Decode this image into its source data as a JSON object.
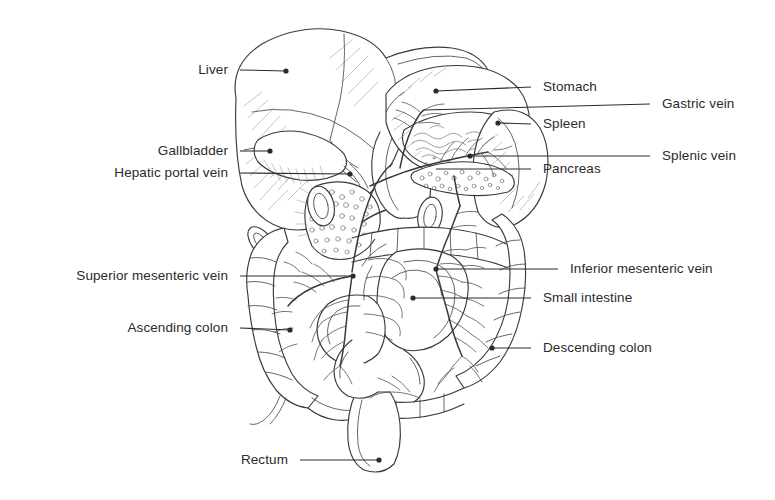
{
  "figure": {
    "type": "anatomical-line-diagram",
    "background_color": "#ffffff",
    "ink_color": "#2b2b2b",
    "leader_line_color": "#2b2b2b",
    "label_font_size_px": 13.5
  },
  "labels": [
    {
      "id": "liver",
      "text": "Liver",
      "side": "left",
      "text_x": 228,
      "text_y": 70,
      "line_x1": 240,
      "line_y1": 70,
      "line_x2": 286,
      "line_y2": 71,
      "dot": true
    },
    {
      "id": "gallbladder",
      "text": "Gallbladder",
      "side": "left",
      "text_x": 228,
      "text_y": 151,
      "line_x1": 240,
      "line_y1": 151,
      "line_x2": 270,
      "line_y2": 151,
      "dot": true
    },
    {
      "id": "hepatic-portal-vein",
      "text": "Hepatic portal vein",
      "side": "left",
      "text_x": 228,
      "text_y": 173,
      "line_x1": 240,
      "line_y1": 173,
      "line_x2": 350,
      "line_y2": 174,
      "dot": true
    },
    {
      "id": "superior-mesenteric-vein",
      "text": "Superior mesenteric vein",
      "side": "left",
      "text_x": 228,
      "text_y": 276,
      "line_x1": 240,
      "line_y1": 276,
      "line_x2": 353,
      "line_y2": 276,
      "dot": true
    },
    {
      "id": "ascending-colon",
      "text": "Ascending colon",
      "side": "left",
      "text_x": 228,
      "text_y": 328,
      "line_x1": 240,
      "line_y1": 328,
      "line_x2": 290,
      "line_y2": 330,
      "dot": true
    },
    {
      "id": "rectum",
      "text": "Rectum",
      "side": "left",
      "text_x": 288,
      "text_y": 460,
      "line_x1": 300,
      "line_y1": 460,
      "line_x2": 379,
      "line_y2": 460,
      "dot": true
    },
    {
      "id": "stomach",
      "text": "Stomach",
      "side": "right",
      "text_x": 543,
      "text_y": 87,
      "line_x1": 531,
      "line_y1": 87,
      "line_x2": 436,
      "line_y2": 91,
      "dot": true
    },
    {
      "id": "gastric-vein",
      "text": "Gastric vein",
      "side": "right",
      "text_x": 662,
      "text_y": 104,
      "line_x1": 650,
      "line_y1": 104,
      "line_x2": 424,
      "line_y2": 110,
      "dot": false
    },
    {
      "id": "spleen",
      "text": "Spleen",
      "side": "right",
      "text_x": 543,
      "text_y": 124,
      "line_x1": 531,
      "line_y1": 124,
      "line_x2": 498,
      "line_y2": 123,
      "dot": true
    },
    {
      "id": "splenic-vein",
      "text": "Splenic vein",
      "side": "right",
      "text_x": 662,
      "text_y": 156,
      "line_x1": 650,
      "line_y1": 156,
      "line_x2": 470,
      "line_y2": 156,
      "dot": true
    },
    {
      "id": "pancreas",
      "text": "Pancreas",
      "side": "right",
      "text_x": 543,
      "text_y": 169,
      "line_x1": 531,
      "line_y1": 169,
      "line_x2": 436,
      "line_y2": 169,
      "dot": false
    },
    {
      "id": "inferior-mesenteric-vein",
      "text": "Inferior mesenteric vein",
      "side": "right",
      "text_x": 570,
      "text_y": 269,
      "line_x1": 558,
      "line_y1": 269,
      "line_x2": 436,
      "line_y2": 269,
      "dot": true
    },
    {
      "id": "small-intestine",
      "text": "Small intestine",
      "side": "right",
      "text_x": 543,
      "text_y": 298,
      "line_x1": 531,
      "line_y1": 298,
      "line_x2": 413,
      "line_y2": 298,
      "dot": true
    },
    {
      "id": "descending-colon",
      "text": "Descending colon",
      "side": "right",
      "text_x": 543,
      "text_y": 348,
      "line_x1": 531,
      "line_y1": 348,
      "line_x2": 492,
      "line_y2": 348,
      "dot": true
    }
  ]
}
